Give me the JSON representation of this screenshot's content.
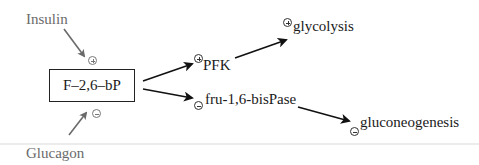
{
  "diagram": {
    "inputs": {
      "insulin": {
        "label": "Insulin",
        "effect": "+"
      },
      "glucagon": {
        "label": "Glucagon",
        "effect": "-"
      }
    },
    "central_node": {
      "label": "F–2,6–bP"
    },
    "targets": {
      "pfk": {
        "label": "PFK",
        "effect": "+"
      },
      "fbpase": {
        "label": "fru-1,6-bisPase",
        "effect": "-"
      }
    },
    "outcomes": {
      "glycolysis": {
        "label": "glycolysis",
        "effect": "+"
      },
      "gluconeogenesis": {
        "label": "gluconeogenesis",
        "effect": "-"
      }
    },
    "colors": {
      "regulator_arrow": "#6a6a6a",
      "pathway_arrow": "#111111",
      "text": "#1a1a1a",
      "regulator_text": "#6a6a6a"
    }
  }
}
